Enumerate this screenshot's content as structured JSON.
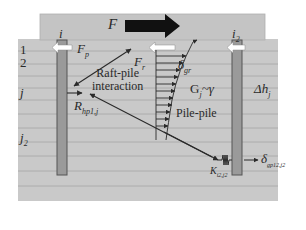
{
  "figure": {
    "colors": {
      "background": "#ffffff",
      "soil": "#c9c9c9",
      "raft": "#c4c4c4",
      "layer_line": "#a9a9a9",
      "pile_fill": "#9a9a9a",
      "pile_edge": "#555555",
      "load_arrow": "#111111",
      "white_arrow": "#ffffff",
      "line": "#2a2a2a"
    }
  },
  "raft": {
    "load_label": "F"
  },
  "piles": [
    {
      "id": "pile-i",
      "top_label": "i",
      "top_sub": ""
    },
    {
      "id": "pile-i2",
      "top_label": "i",
      "top_sub": "2"
    }
  ],
  "layers": {
    "labels": [
      {
        "text": "1",
        "sub": ""
      },
      {
        "text": "2",
        "sub": ""
      },
      {
        "text": "j",
        "sub": ""
      },
      {
        "text": "j",
        "sub": "2"
      }
    ],
    "thickness_label": "Δh",
    "thickness_sub": "j"
  },
  "forces": {
    "pile_force": {
      "text": "F",
      "sub": "p"
    },
    "raft_force": {
      "text": "F",
      "sub": "r"
    },
    "soil_disp": {
      "text": "δ",
      "sub": "gr"
    },
    "shear_modulus": {
      "text": "G",
      "sub": "j",
      "suffix": "~γ"
    },
    "resistance": {
      "text": "R",
      "sub": "hp1,j"
    },
    "spring": {
      "text": "K",
      "sub": "i2,j2"
    },
    "pile_disp": {
      "text": "δ",
      "sub": "gp12,j2"
    }
  },
  "annotations": {
    "raft_pile_line1": "Raft-pile",
    "raft_pile_line2": "interaction",
    "pile_pile": "Pile-pile"
  }
}
